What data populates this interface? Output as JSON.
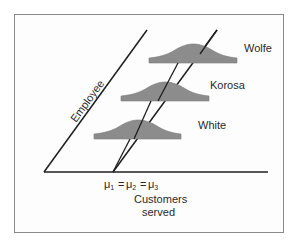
{
  "diagram": {
    "axis_labels": {
      "vertical_oblique": "Employee",
      "horizontal_line1": "Customers",
      "horizontal_line2": "served"
    },
    "mean_annotation": {
      "mu": "μ",
      "sub1": "1",
      "sub2": "2",
      "sub3": "3",
      "equals": "="
    },
    "distributions": [
      {
        "label": "Wolfe"
      },
      {
        "label": "Korosa"
      },
      {
        "label": "White"
      }
    ],
    "colors": {
      "axis": "#1e1e1e",
      "curve_fill": "#8c8c8c",
      "text": "#2a2a2a",
      "frame_border": "#8a8a8a"
    }
  }
}
